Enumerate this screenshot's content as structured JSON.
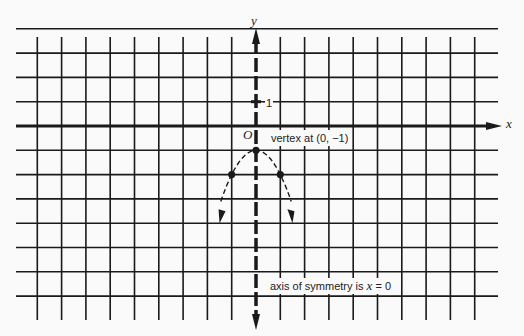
{
  "diagram": {
    "axis_labels": {
      "x": "x",
      "y": "y",
      "origin": "O"
    },
    "tick_label": "1",
    "annotations": {
      "vertex": "vertex at (0, −1)",
      "axis_of_symmetry_prefix": "axis of symmetry is ",
      "axis_of_symmetry_var": "x",
      "axis_of_symmetry_suffix": " = 0"
    },
    "grid": {
      "x_range": [
        -9,
        9
      ],
      "y_range": [
        -7,
        4
      ],
      "step": 1
    },
    "parabola": {
      "equation": "y = -x^2 - 1",
      "vertex": [
        0,
        -1
      ],
      "points": [
        [
          -1,
          -2
        ],
        [
          0,
          -1
        ],
        [
          1,
          -2
        ]
      ],
      "arrow_ends": [
        [
          -1.5,
          -4
        ],
        [
          1.5,
          -4
        ]
      ]
    },
    "colors": {
      "ink": "#1a1a1a",
      "paper": "#fafafa"
    }
  }
}
